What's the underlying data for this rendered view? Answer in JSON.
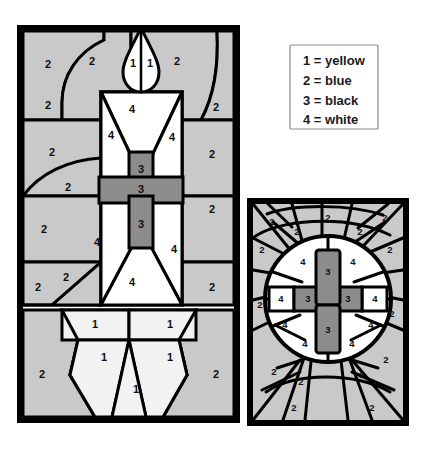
{
  "page": {
    "background_color": "#ffffff"
  },
  "palette": {
    "color_1_fill": "#f2f2f2",
    "color_2_fill": "#c9c9c9",
    "color_3_fill": "#8c8c8c",
    "color_4_fill": "#ffffff",
    "lead_line_color": "#000000",
    "frame_color": "#000000",
    "legend_border_color": "#8a8a8a",
    "text_color": "#101010"
  },
  "legend": {
    "name": "color-key",
    "entries": [
      {
        "number": "1",
        "separator": "=",
        "color_name": "yellow",
        "line": "1 = yellow"
      },
      {
        "number": "2",
        "separator": "=",
        "color_name": "blue",
        "line": "2 = blue"
      },
      {
        "number": "3",
        "separator": "=",
        "color_name": "black",
        "line": "3 = black"
      },
      {
        "number": "4",
        "separator": "=",
        "color_name": "white",
        "line": "4 = white"
      }
    ]
  },
  "panels": [
    {
      "id": "candle-panel",
      "label": "Candle stained glass panel",
      "subject": "lit candle with cross",
      "region_count": 27
    },
    {
      "id": "cross-panel",
      "label": "Cross and sunburst stained glass panel",
      "subject": "cross inside radiant circle",
      "region_count": 33
    }
  ],
  "candle_panel_labels": {
    "flame_left": "1",
    "flame_right": "1",
    "bg_top_left": "2",
    "bg_top_left_outer": "2",
    "bg_top_right": "2",
    "bg_mid_right_upper": "2",
    "bg_mid_left_upper": "2",
    "bg_mid_left_lower": "2",
    "bg_mid_right_lower": "2",
    "bg_low_left": "2",
    "bg_low_left_inner": "2",
    "bg_low_right_upper": "2",
    "bg_low_right_lower": "2",
    "bg_bottom_left": "2",
    "bg_bottom_right": "2",
    "candle_top": "4",
    "candle_left": "4",
    "candle_right": "4",
    "candle_bottom": "4",
    "cross_upper": "3",
    "cross_arm": "3",
    "cross_lower": "3",
    "base_top_left": "1",
    "base_top_right": "1",
    "base_mid_left": "1",
    "base_mid_right": "1",
    "base_center": "1"
  },
  "cross_panel_labels": {
    "ray_tl_outer": "2",
    "ray_tl_inner": "2",
    "ray_top_center": "2",
    "ray_tr_inner": "2",
    "ray_tr_outer": "2",
    "ray_left_upper": "2",
    "ray_right_upper": "2",
    "ray_left_mid": "2",
    "ray_right_mid": "2",
    "ray_bl_outer": "2",
    "ray_bl_inner": "2",
    "ray_br_inner": "2",
    "ray_br_outer": "2",
    "ray_bottom_left": "2",
    "ray_bottom_right": "2",
    "disc_tl": "4",
    "disc_tr": "4",
    "disc_far_left": "4",
    "disc_far_right": "4",
    "disc_left_mid": "4",
    "disc_right_mid": "4",
    "disc_bl": "4",
    "disc_br": "4",
    "cross_top": "3",
    "cross_left_arm": "3",
    "cross_right_arm": "3",
    "cross_bottom": "3"
  }
}
